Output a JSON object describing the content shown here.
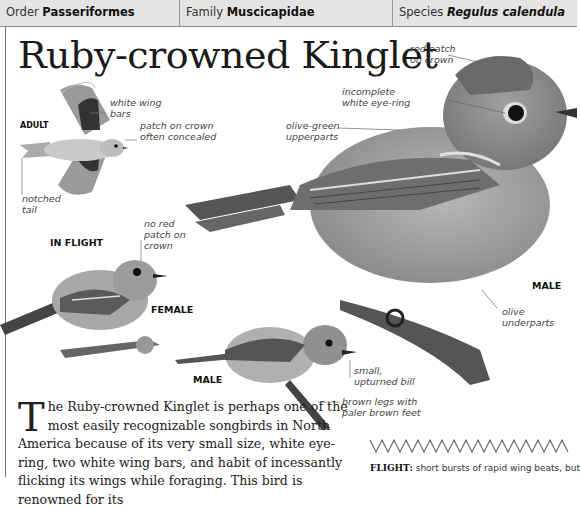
{
  "header": {
    "order": {
      "label": "Order",
      "value": "Passeriformes"
    },
    "family": {
      "label": "Family",
      "value": "Muscicapidae"
    },
    "species": {
      "label": "Species",
      "value": "Regulus calendula"
    }
  },
  "title": "Ruby-crowned Kinglet",
  "illustration": {
    "tags": {
      "adult": "ADULT",
      "in_flight": "IN FLIGHT",
      "female": "FEMALE",
      "male_small": "MALE",
      "male_large": "MALE"
    },
    "callouts": {
      "white_wing_bars": [
        "white wing",
        "bars"
      ],
      "patch_concealed": [
        "patch on crown",
        "often concealed"
      ],
      "notched_tail": [
        "notched",
        "tail"
      ],
      "no_red_patch": [
        "no red",
        "patch on",
        "crown"
      ],
      "red_patch": [
        "red patch",
        "on crown"
      ],
      "eye_ring": [
        "incomplete",
        "white eye-ring"
      ],
      "upperparts": [
        "olive-green",
        "upperparts"
      ],
      "underparts": [
        "olive",
        "underparts"
      ],
      "bill": [
        "small,",
        "upturned bill"
      ],
      "legs": [
        "brown legs with",
        "paler brown feet"
      ]
    }
  },
  "body_text": {
    "dropcap": "T",
    "text": "he Ruby-crowned Kinglet is perhaps one of the most easily recognizable songbirds in North America because of its very small size, white eye-ring, two white wing bars, and habit of incessantly flicking its wings while foraging. This bird is renowned for its"
  },
  "flight": {
    "label": "FLIGHT:",
    "text": "short bursts of rapid wing beats, but"
  }
}
